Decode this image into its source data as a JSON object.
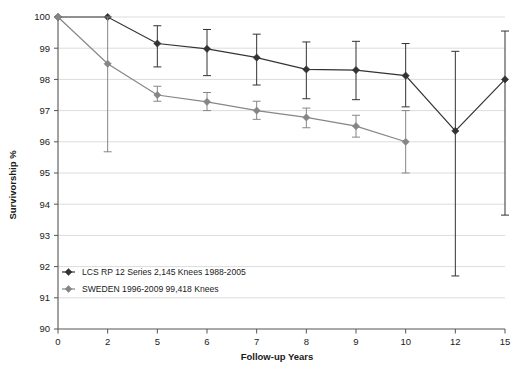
{
  "chart_data": {
    "type": "line",
    "title": "",
    "xlabel": "Follow-up Years",
    "ylabel": "Survivorship %",
    "categories": [
      "0",
      "2",
      "5",
      "6",
      "7",
      "8",
      "9",
      "10",
      "12",
      "15"
    ],
    "x_tick_labels": [
      "0",
      "2",
      "5",
      "6",
      "7",
      "8",
      "9",
      "10",
      "12",
      "15"
    ],
    "y_tick_labels": [
      "90",
      "91",
      "92",
      "93",
      "94",
      "95",
      "96",
      "97",
      "98",
      "99",
      "100"
    ],
    "ylim": [
      90,
      100
    ],
    "y_step": 1,
    "grid": "horizontal",
    "legend_position": "bottom-left",
    "series": [
      {
        "name": "LCS RP 12 Series 2,145 Knees 1988-2005",
        "color": "#333333",
        "marker": "diamond",
        "values": [
          100,
          100,
          99.15,
          98.98,
          98.7,
          98.32,
          98.3,
          98.12,
          96.35,
          98.0
        ],
        "error_low": [
          100,
          100,
          98.4,
          98.12,
          97.82,
          97.38,
          97.35,
          97.12,
          91.7,
          93.65
        ],
        "error_high": [
          100,
          100,
          99.72,
          99.6,
          99.45,
          99.2,
          99.22,
          99.15,
          98.9,
          99.55
        ]
      },
      {
        "name": "SWEDEN 1996-2009 99,418 Knees",
        "color": "#868686",
        "marker": "diamond",
        "values": [
          100,
          98.5,
          97.5,
          97.28,
          97.0,
          96.78,
          96.5,
          96.0,
          null,
          null
        ],
        "error_low": [
          100,
          95.68,
          97.3,
          97.0,
          96.72,
          96.45,
          96.15,
          95.0,
          null,
          null
        ],
        "error_high": [
          100,
          100.0,
          97.78,
          97.58,
          97.3,
          97.08,
          96.85,
          97.0,
          null,
          null
        ]
      }
    ]
  },
  "legend": {
    "entries": [
      {
        "label": "LCS RP 12 Series 2,145 Knees 1988-2005"
      },
      {
        "label": "SWEDEN 1996-2009 99,418 Knees"
      }
    ]
  },
  "axes": {
    "y_axis_title": "Survivorship %",
    "x_axis_title": "Follow-up Years"
  },
  "style": {
    "series_dark": "#333333",
    "series_gray": "#868686",
    "grid_color": "#dcdcdc",
    "axis_color": "#555555",
    "background": "#ffffff"
  }
}
